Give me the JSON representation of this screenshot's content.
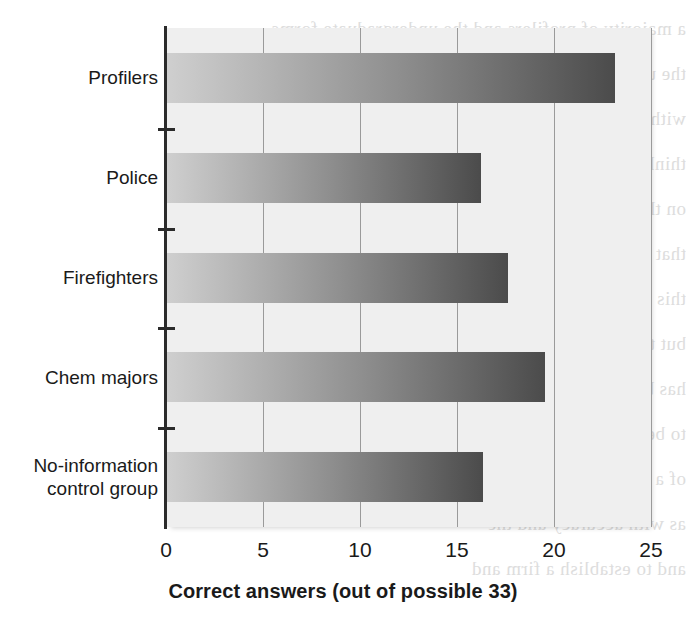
{
  "chart_data": {
    "type": "bar",
    "orientation": "horizontal",
    "title": "",
    "xlabel": "Correct answers (out of possible 33)",
    "ylabel": "",
    "xlim": [
      0,
      25
    ],
    "xticks": [
      "0",
      "5",
      "10",
      "15",
      "20",
      "25"
    ],
    "xtick_values": [
      0,
      5,
      10,
      15,
      20,
      25
    ],
    "grid": "vertical",
    "legend": "none",
    "max_possible": 33,
    "categories": [
      "Profilers",
      "Police",
      "Firefighters",
      "Chem majors",
      "No-information control group"
    ],
    "category_label_lines": [
      [
        "Profilers"
      ],
      [
        "Police"
      ],
      [
        "Firefighters"
      ],
      [
        "Chem majors"
      ],
      [
        "No-information",
        "control group"
      ]
    ],
    "values": [
      23.1,
      16.2,
      17.6,
      19.5,
      16.3
    ],
    "bars": [
      {
        "label": "Profilers",
        "value": 23.1
      },
      {
        "label": "Police",
        "value": 16.2
      },
      {
        "label": "Firefighters",
        "value": 17.6
      },
      {
        "label": "Chem majors",
        "value": 19.5
      },
      {
        "label": "No-information control group",
        "value": 16.3
      }
    ],
    "colors": {
      "bar_gradient_start": "#cfcfcf",
      "bar_gradient_end": "#4b4b4b",
      "plot_background": "#efefef",
      "gridline": "#9a9a9a",
      "axis": "#2b2b2b",
      "text": "#1a1a1a",
      "page_background": "#ffffff"
    }
  },
  "background_text": {
    "lines": [
      "a majority of profilers and the undergraduate forms",
      "the undergraduate group per item",
      "with 16 you rank them with",
      "think about the actual number of",
      "on the (mirror image) than to your",
      "that in profilers. Even so, this is a very",
      "this group shows a higher accuracy",
      "but this difference is not",
      "has been noted and observed",
      "to be considered only the",
      "of a police officers, but not",
      "as with accuracy and the",
      "and to establish a firm and"
    ]
  }
}
